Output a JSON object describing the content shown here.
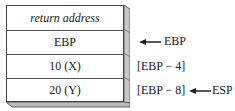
{
  "stack": {
    "cells": [
      {
        "label": "return address",
        "italic": true
      },
      {
        "label": "EBP"
      },
      {
        "label": "10 (X)"
      },
      {
        "label": "20 (Y)"
      }
    ]
  },
  "annotations": {
    "ebp_pointer": "EBP",
    "x_offset": "[EBP − 4]",
    "y_offset": "[EBP − 8]",
    "esp_pointer": "ESP"
  },
  "colors": {
    "border": "#444444",
    "side_face": "#c8c8c8",
    "bottom_face": "#bbbbbb"
  }
}
